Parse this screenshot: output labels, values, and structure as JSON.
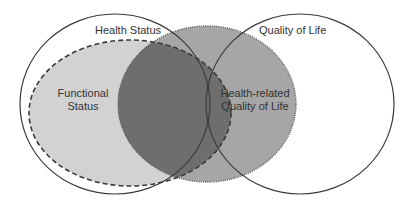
{
  "diagram": {
    "type": "venn",
    "sets": [
      {
        "id": "health-status",
        "label": "Health Status",
        "style": "solid outline, no fill"
      },
      {
        "id": "quality-of-life",
        "label": "Quality of Life",
        "style": "solid outline, no fill"
      },
      {
        "id": "functional-status",
        "label_line1": "Functional",
        "label_line2": "Status",
        "style": "dashed outline, light grey fill"
      },
      {
        "id": "hrqol",
        "label_line1": "Health-related",
        "label_line2": "Quality of Life",
        "style": "dotted outline, medium grey fill"
      }
    ],
    "relationships": [
      "Functional Status is contained within Health Status",
      "Health-related Quality of Life lies in the overlap of Health Status and Quality of Life",
      "Functional Status overlaps Health-related Quality of Life (dark grey region)"
    ]
  },
  "labels": {
    "health_status": "Health Status",
    "quality_of_life": "Quality of Life",
    "functional_line1": "Functional",
    "functional_line2": "Status",
    "hrqol_line1": "Health-related",
    "hrqol_line2": "Quality of Life"
  },
  "colors": {
    "background": "#ffffff",
    "outline": "#3a3a3a",
    "functional_fill": "#d2d2d2",
    "hrqol_fill": "#a6a6a6",
    "overlap_fill": "#6e6e6e",
    "text": "#333333"
  }
}
